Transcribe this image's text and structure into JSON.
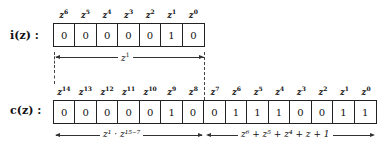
{
  "top": {
    "label": "i(z) :",
    "exponents": [
      "6",
      "5",
      "4",
      "3",
      "2",
      "1",
      "0"
    ],
    "bits": [
      "0",
      "0",
      "0",
      "0",
      "0",
      "1",
      "0"
    ],
    "brace": {
      "base": "z",
      "exp": "1"
    }
  },
  "bottom": {
    "label": "c(z) :",
    "exponents": [
      "14",
      "13",
      "12",
      "11",
      "10",
      "9",
      "8",
      "7",
      "6",
      "5",
      "4",
      "3",
      "2",
      "1",
      "0"
    ],
    "bits": [
      "0",
      "0",
      "0",
      "0",
      "0",
      "1",
      "0",
      "0",
      "1",
      "1",
      "1",
      "0",
      "0",
      "1",
      "1"
    ],
    "left_brace": {
      "text": "z¹ · z¹⁵⁻⁷"
    },
    "right_brace": {
      "text": "z⁶ + z⁵ + z⁴ + z + 1"
    }
  }
}
